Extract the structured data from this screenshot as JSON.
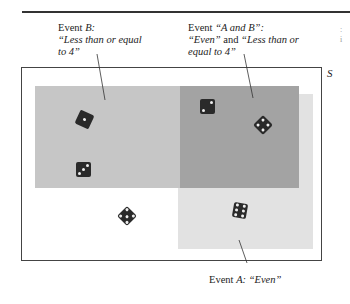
{
  "diagram": {
    "sample_space_label": "S",
    "event_b": {
      "line1_prefix": "Event ",
      "line1_em": "B:",
      "line2": "“Less than or equal",
      "line3": "to 4”"
    },
    "event_ab": {
      "line1_prefix": "Event ",
      "line1_em": "“A and B”:",
      "line2_em1": "“Even”",
      "line2_mid": " and ",
      "line2_em2": "“Less than or",
      "line3": "equal to 4”"
    },
    "event_a": {
      "prefix": "Event ",
      "em": "A: “Even”"
    },
    "colors": {
      "b_only": "#c6c6c6",
      "a_only": "#e2e2e2",
      "overlap": "#a3a3a3",
      "die": "#2a2a2a"
    },
    "dice": [
      {
        "value": 1,
        "region": "B only"
      },
      {
        "value": 3,
        "region": "B only"
      },
      {
        "value": 2,
        "region": "A and B"
      },
      {
        "value": 4,
        "region": "A and B"
      },
      {
        "value": 5,
        "region": "neither"
      },
      {
        "value": 6,
        "region": "A only"
      }
    ]
  }
}
